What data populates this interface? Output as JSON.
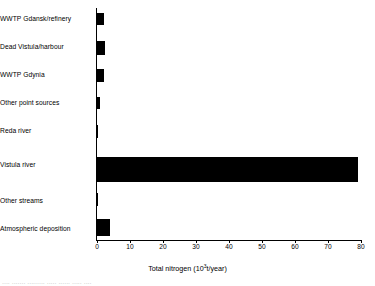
{
  "chart_data": {
    "type": "bar",
    "orientation": "horizontal",
    "title": "",
    "xlabel": "Total nitrogen (10³t/year)",
    "xlabel_parts": {
      "prefix": "Total nitrogen (10",
      "exponent": "3",
      "suffix": "t/year)"
    },
    "ylabel": "",
    "categories": [
      "WWTP Gdansk/refinery",
      "Dead Vistula/harbour",
      "WWTP Gdynia",
      "Other point sources",
      "Reda river",
      "Vistula river",
      "Other streams",
      "Atmospheric deposition"
    ],
    "values": [
      2.1,
      2.5,
      2.0,
      0.8,
      0.4,
      79.0,
      0.1,
      4.0
    ],
    "xlim": [
      0,
      80
    ],
    "xticks": [
      0,
      10,
      20,
      30,
      40,
      50,
      60,
      70,
      80
    ],
    "xtick_labels": [
      "0",
      "10",
      "20",
      "30",
      "40",
      "50",
      "60",
      "70",
      "80"
    ],
    "grid": false,
    "legend": null,
    "bar_color": "#000000",
    "axis_color": "#000000",
    "background": "#ffffff"
  },
  "caption": {
    "remnant_text": "....  ....... .........  ..... ......  ..... ...."
  }
}
